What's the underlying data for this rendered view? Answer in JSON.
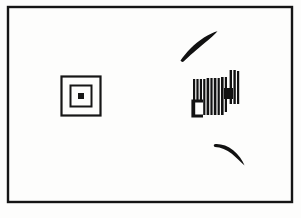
{
  "figure": {
    "title": "Scanned line drawing with concentric squares, striped barcode glyph and two crescent strokes",
    "caption": "",
    "background_color": "#fdfdfc",
    "ink_color": "#111111",
    "border": {
      "name": "outer-frame",
      "x": 8,
      "y": 7,
      "width": 284,
      "height": 195,
      "stroke_width": 2.4,
      "color": "#151515"
    },
    "elements": [
      {
        "name": "concentric-squares",
        "type": "nested-squares",
        "count": 3,
        "center_x": 81,
        "center_y": 96,
        "squares": [
          {
            "size": 39,
            "stroke": 2.2,
            "filled": false
          },
          {
            "size": 21,
            "stroke": 2.0,
            "filled": false
          },
          {
            "size": 6,
            "stroke": 0,
            "filled": true
          }
        ],
        "color": "#161616"
      },
      {
        "name": "striped-barcode-glyph",
        "type": "vertical-bars",
        "x": 193,
        "y": 70,
        "width": 46,
        "height": 45,
        "color": "#121212",
        "bars": [
          {
            "x": 193.0,
            "width": 2.2,
            "top": 79,
            "bottom": 115
          },
          {
            "x": 196.4,
            "width": 2.2,
            "top": 79,
            "bottom": 101
          },
          {
            "x": 199.8,
            "width": 2.2,
            "top": 79,
            "bottom": 101
          },
          {
            "x": 203.2,
            "width": 2.2,
            "top": 79,
            "bottom": 115
          },
          {
            "x": 206.6,
            "width": 2.6,
            "top": 78,
            "bottom": 115
          },
          {
            "x": 210.4,
            "width": 2.2,
            "top": 78,
            "bottom": 115
          },
          {
            "x": 213.8,
            "width": 2.6,
            "top": 78,
            "bottom": 115
          },
          {
            "x": 217.6,
            "width": 2.2,
            "top": 78,
            "bottom": 115
          },
          {
            "x": 221.0,
            "width": 2.6,
            "top": 77,
            "bottom": 115
          },
          {
            "x": 224.8,
            "width": 2.2,
            "top": 77,
            "bottom": 112
          },
          {
            "x": 229.6,
            "width": 2.4,
            "top": 70,
            "bottom": 104
          },
          {
            "x": 233.4,
            "width": 2.4,
            "top": 70,
            "bottom": 104
          },
          {
            "x": 237.0,
            "width": 2.2,
            "top": 71,
            "bottom": 104
          }
        ],
        "solid_block": {
          "x": 224,
          "y": 88,
          "width": 9,
          "height": 11
        },
        "bracket": {
          "x": 193,
          "y": 101,
          "width": 10,
          "height": 15,
          "stroke": 3.2
        }
      },
      {
        "name": "upper-crescent-stroke",
        "type": "brush-arc",
        "orientation": "opens-down-left",
        "bbox": {
          "x": 178,
          "y": 31,
          "width": 40,
          "height": 30
        },
        "color": "#111111"
      },
      {
        "name": "lower-crescent-stroke",
        "type": "brush-arc",
        "orientation": "opens-up-left",
        "bbox": {
          "x": 214,
          "y": 142,
          "width": 31,
          "height": 24
        },
        "color": "#111111"
      }
    ]
  }
}
